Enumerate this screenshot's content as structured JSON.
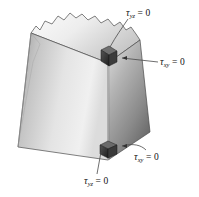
{
  "figure": {
    "background_color": "#ffffff",
    "body": {
      "name": "trapezoidal-block",
      "description": "Three-dimensional trapezoidal prism with a torn upper edge, shown in isometric view",
      "faces": [
        {
          "name": "top-face",
          "shade": "light"
        },
        {
          "name": "front-left-face",
          "shade": "mid"
        },
        {
          "name": "front-right-face",
          "shade": "dark"
        }
      ],
      "top_edge_style": "torn-jagged"
    },
    "stress_elements": [
      {
        "name": "upper-stress-element",
        "position": "upper front vertical edge"
      },
      {
        "name": "lower-stress-element",
        "position": "lower front vertical edge"
      }
    ],
    "labels": [
      {
        "id": "tau-yz-top",
        "tau": "τ",
        "subscript": "yz",
        "equals_zero": "= 0",
        "full_text": "τyz = 0",
        "leader": "curved leader to upper stress element"
      },
      {
        "id": "tau-xy-right",
        "tau": "τ",
        "subscript": "xy",
        "equals_zero": "= 0",
        "full_text": "τxy = 0",
        "leader": "horizontal leader with arrow to upper stress element"
      },
      {
        "id": "tau-xy-bottom",
        "tau": "τ",
        "subscript": "xy",
        "equals_zero": "= 0",
        "full_text": "τxy = 0",
        "leader": "curved leader to lower stress element"
      },
      {
        "id": "tau-yz-bottom",
        "tau": "τ",
        "subscript": "yz",
        "equals_zero": "= 0",
        "full_text": "τyz = 0",
        "leader": "vertical leader to lower stress element"
      }
    ],
    "colors": {
      "outline": "#3a3a3a",
      "label_text": "#111111",
      "leader_line": "#4a4a4a",
      "top_face_light": "#f2f2f2",
      "top_face_dark": "#c9c9c9",
      "left_face_light": "#efefef",
      "left_face_dark": "#a8a8a8",
      "right_face_light": "#d8d8d8",
      "right_face_dark": "#6e6e6e",
      "element_fill": "#2f2f2f"
    }
  }
}
